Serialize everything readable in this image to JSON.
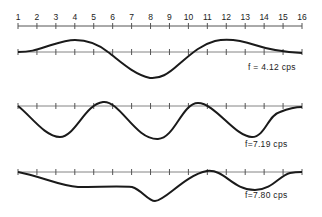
{
  "figure": {
    "scale": {
      "ticks": [
        "1",
        "2",
        "3",
        "4",
        "5",
        "6",
        "7",
        "8",
        "9",
        "10",
        "11",
        "12",
        "13",
        "14",
        "15",
        "16"
      ]
    },
    "modes": [
      {
        "label": "f = 4.12 cps"
      },
      {
        "label": "f=7.19 cps"
      },
      {
        "label": "f=7.80 cps"
      }
    ]
  },
  "colors": {
    "line": "#1a1a1a",
    "axis": "#555555",
    "background": "#ffffff"
  }
}
